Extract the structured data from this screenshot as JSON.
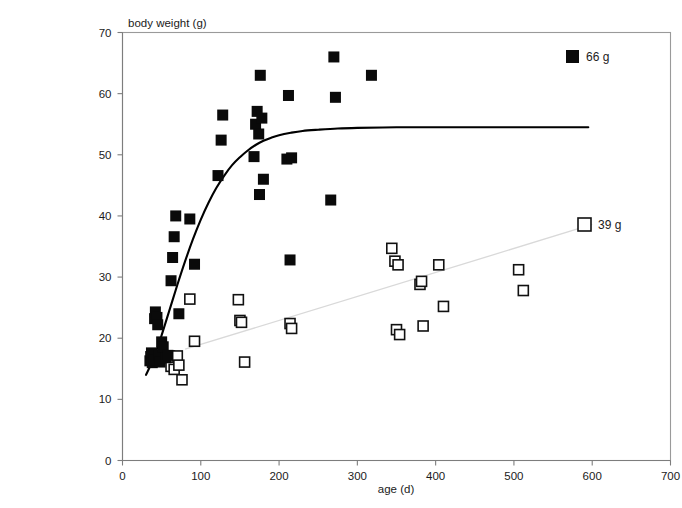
{
  "chart_data": {
    "type": "scatter",
    "title": "",
    "xlabel": "age (d)",
    "ylabel": "body weight (g)",
    "xlim": [
      0,
      700
    ],
    "ylim": [
      0,
      70
    ],
    "xticks": [
      0,
      100,
      200,
      300,
      400,
      500,
      600,
      700
    ],
    "yticks": [
      0,
      10,
      20,
      30,
      40,
      50,
      60,
      70
    ],
    "grid": false,
    "legend_position": "right",
    "series": [
      {
        "name": "66 g",
        "marker": "filled-square",
        "color": "#0a0a0a",
        "points": [
          [
            35,
            16.3
          ],
          [
            36,
            17.0
          ],
          [
            37,
            17.6
          ],
          [
            38,
            16.0
          ],
          [
            40,
            16.4
          ],
          [
            41,
            23.2
          ],
          [
            42,
            24.3
          ],
          [
            44,
            23.4
          ],
          [
            45,
            22.2
          ],
          [
            46,
            17.2
          ],
          [
            48,
            16.1
          ],
          [
            50,
            19.4
          ],
          [
            52,
            18.6
          ],
          [
            55,
            16.8
          ],
          [
            58,
            17.2
          ],
          [
            62,
            29.4
          ],
          [
            64,
            33.2
          ],
          [
            66,
            36.6
          ],
          [
            68,
            40.0
          ],
          [
            72,
            24.0
          ],
          [
            86,
            39.5
          ],
          [
            92,
            32.1
          ],
          [
            122,
            46.6
          ],
          [
            126,
            52.4
          ],
          [
            128,
            56.5
          ],
          [
            168,
            49.7
          ],
          [
            170,
            55.0
          ],
          [
            172,
            57.1
          ],
          [
            174,
            53.4
          ],
          [
            175,
            43.5
          ],
          [
            176,
            63.0
          ],
          [
            178,
            56.0
          ],
          [
            180,
            46.0
          ],
          [
            210,
            49.3
          ],
          [
            212,
            59.7
          ],
          [
            214,
            32.8
          ],
          [
            216,
            49.5
          ],
          [
            266,
            42.6
          ],
          [
            270,
            66.0
          ],
          [
            272,
            59.4
          ],
          [
            318,
            63.0
          ]
        ]
      },
      {
        "name": "39 g",
        "marker": "open-square",
        "color": "#ffffff",
        "points": [
          [
            56,
            16.8
          ],
          [
            60,
            17.1
          ],
          [
            62,
            15.4
          ],
          [
            64,
            16.9
          ],
          [
            66,
            14.9
          ],
          [
            70,
            17.1
          ],
          [
            72,
            15.6
          ],
          [
            76,
            13.2
          ],
          [
            86,
            26.4
          ],
          [
            92,
            19.5
          ],
          [
            148,
            26.3
          ],
          [
            150,
            22.9
          ],
          [
            152,
            22.6
          ],
          [
            156,
            16.1
          ],
          [
            214,
            22.4
          ],
          [
            216,
            21.6
          ],
          [
            344,
            34.7
          ],
          [
            348,
            32.6
          ],
          [
            352,
            32.0
          ],
          [
            350,
            21.4
          ],
          [
            354,
            20.6
          ],
          [
            380,
            28.8
          ],
          [
            382,
            29.3
          ],
          [
            384,
            22.0
          ],
          [
            404,
            32.0
          ],
          [
            410,
            25.2
          ],
          [
            506,
            31.2
          ],
          [
            512,
            27.8
          ]
        ]
      }
    ],
    "fit_curve": {
      "name": "gompertz-fit",
      "series_ref": "66 g",
      "asymptote": 54.5,
      "points": [
        [
          30,
          14.0
        ],
        [
          40,
          16.8
        ],
        [
          50,
          20.5
        ],
        [
          60,
          24.6
        ],
        [
          70,
          28.7
        ],
        [
          80,
          32.6
        ],
        [
          90,
          36.2
        ],
        [
          100,
          39.4
        ],
        [
          110,
          42.2
        ],
        [
          120,
          44.6
        ],
        [
          130,
          46.6
        ],
        [
          140,
          48.3
        ],
        [
          150,
          49.6
        ],
        [
          160,
          50.7
        ],
        [
          170,
          51.6
        ],
        [
          180,
          52.3
        ],
        [
          190,
          52.8
        ],
        [
          200,
          53.2
        ],
        [
          215,
          53.6
        ],
        [
          230,
          53.9
        ],
        [
          250,
          54.1
        ],
        [
          275,
          54.3
        ],
        [
          300,
          54.4
        ],
        [
          350,
          54.5
        ],
        [
          400,
          54.5
        ],
        [
          450,
          54.5
        ],
        [
          500,
          54.5
        ],
        [
          550,
          54.5
        ],
        [
          595,
          54.5
        ]
      ]
    },
    "trend_line": {
      "name": "39-g-trend",
      "series_ref": "39 g",
      "points": [
        [
          80,
          18.2
        ],
        [
          600,
          38.6
        ]
      ],
      "color": "#d9d9d9"
    }
  },
  "legend": {
    "items": [
      {
        "label": "66 g",
        "marker": "filled-square"
      },
      {
        "label": "39 g",
        "marker": "open-square"
      }
    ]
  },
  "axes": {
    "y_axis_title": "body weight (g)",
    "x_axis_title": "age (d)",
    "x_tick_labels": [
      "0",
      "100",
      "200",
      "300",
      "400",
      "500",
      "600",
      "700"
    ],
    "y_tick_labels": [
      "0",
      "10",
      "20",
      "30",
      "40",
      "50",
      "60",
      "70"
    ]
  }
}
